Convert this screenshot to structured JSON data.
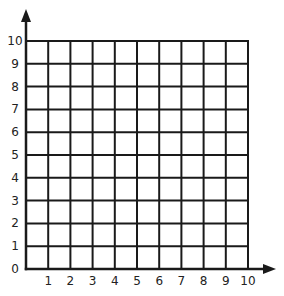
{
  "diagram": {
    "type": "coordinate-grid",
    "x_axis": {
      "min": 0,
      "max": 10,
      "tick_labels": [
        "1",
        "2",
        "3",
        "4",
        "5",
        "6",
        "7",
        "8",
        "9",
        "10"
      ],
      "has_arrow": true
    },
    "y_axis": {
      "min": 0,
      "max": 10,
      "tick_labels": [
        "0",
        "1",
        "2",
        "3",
        "4",
        "5",
        "6",
        "7",
        "8",
        "9",
        "10"
      ],
      "has_arrow": true
    },
    "grid": {
      "columns": 10,
      "rows": 10
    },
    "colors": {
      "line": "#1a1a1a",
      "label": "#222222",
      "background": "#ffffff"
    }
  }
}
